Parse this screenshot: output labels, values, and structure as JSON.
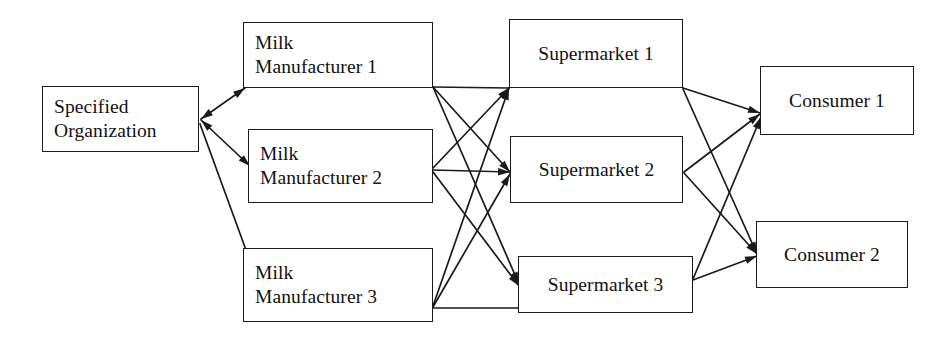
{
  "diagram": {
    "canvas": {
      "width": 952,
      "height": 337
    },
    "style": {
      "background": "#ffffff",
      "stroke": "#1a1a1a",
      "text": "#111111"
    },
    "nodes": [
      {
        "id": "specified-organization",
        "label": "Specified\nOrganization",
        "tier": "organization",
        "x": 42,
        "y": 86,
        "w": 157,
        "h": 66,
        "align": "left"
      },
      {
        "id": "milk-manufacturer-1",
        "label": "Milk\nManufacturer 1",
        "tier": "manufacturer",
        "x": 243,
        "y": 22,
        "w": 190,
        "h": 66,
        "align": "left"
      },
      {
        "id": "milk-manufacturer-2",
        "label": "Milk\nManufacturer 2",
        "tier": "manufacturer",
        "x": 248,
        "y": 129,
        "w": 185,
        "h": 74,
        "align": "left"
      },
      {
        "id": "milk-manufacturer-3",
        "label": "Milk\nManufacturer 3",
        "tier": "manufacturer",
        "x": 243,
        "y": 248,
        "w": 190,
        "h": 74,
        "align": "left"
      },
      {
        "id": "supermarket-1",
        "label": "Supermarket 1",
        "tier": "supermarket",
        "x": 509,
        "y": 19,
        "w": 174,
        "h": 69,
        "align": "center"
      },
      {
        "id": "supermarket-2",
        "label": "Supermarket 2",
        "tier": "supermarket",
        "x": 510,
        "y": 136,
        "w": 173,
        "h": 67,
        "align": "center"
      },
      {
        "id": "supermarket-3",
        "label": "Supermarket 3",
        "tier": "supermarket",
        "x": 518,
        "y": 256,
        "w": 175,
        "h": 57,
        "align": "center"
      },
      {
        "id": "consumer-1",
        "label": "Consumer 1",
        "tier": "consumer",
        "x": 760,
        "y": 66,
        "w": 154,
        "h": 69,
        "align": "center"
      },
      {
        "id": "consumer-2",
        "label": "Consumer 2",
        "tier": "consumer",
        "x": 756,
        "y": 221,
        "w": 152,
        "h": 67,
        "align": "center"
      }
    ],
    "edges": [
      {
        "id": "org-to-mm1",
        "from": "specified-organization",
        "to": "milk-manufacturer-1",
        "x1": 201,
        "y1": 119,
        "x2": 245,
        "y2": 88,
        "arrow": "both"
      },
      {
        "id": "org-to-mm2",
        "from": "specified-organization",
        "to": "milk-manufacturer-2",
        "x1": 201,
        "y1": 120,
        "x2": 250,
        "y2": 166,
        "arrow": "both"
      },
      {
        "id": "org-to-mm3",
        "from": "specified-organization",
        "to": "milk-manufacturer-3",
        "x1": 200,
        "y1": 124,
        "x2": 246,
        "y2": 250,
        "arrow": "none"
      },
      {
        "id": "mm1-to-sm1",
        "from": "milk-manufacturer-1",
        "to": "supermarket-1",
        "x1": 433,
        "y1": 87,
        "x2": 509,
        "y2": 88,
        "arrow": "none"
      },
      {
        "id": "mm1-to-sm2",
        "from": "milk-manufacturer-1",
        "to": "supermarket-2",
        "x1": 433,
        "y1": 87,
        "x2": 510,
        "y2": 172,
        "arrow": "end"
      },
      {
        "id": "mm1-to-sm3",
        "from": "milk-manufacturer-1",
        "to": "supermarket-3",
        "x1": 433,
        "y1": 87,
        "x2": 519,
        "y2": 284,
        "arrow": "end"
      },
      {
        "id": "mm2-to-sm1",
        "from": "milk-manufacturer-2",
        "to": "supermarket-1",
        "x1": 433,
        "y1": 168,
        "x2": 509,
        "y2": 88,
        "arrow": "end"
      },
      {
        "id": "mm2-to-sm2",
        "from": "milk-manufacturer-2",
        "to": "supermarket-2",
        "x1": 433,
        "y1": 170,
        "x2": 510,
        "y2": 172,
        "arrow": "end"
      },
      {
        "id": "mm2-to-sm3",
        "from": "milk-manufacturer-2",
        "to": "supermarket-3",
        "x1": 433,
        "y1": 172,
        "x2": 519,
        "y2": 286,
        "arrow": "end"
      },
      {
        "id": "mm3-to-sm1",
        "from": "milk-manufacturer-3",
        "to": "supermarket-1",
        "x1": 433,
        "y1": 306,
        "x2": 509,
        "y2": 88,
        "arrow": "end"
      },
      {
        "id": "mm3-to-sm2",
        "from": "milk-manufacturer-3",
        "to": "supermarket-2",
        "x1": 433,
        "y1": 307,
        "x2": 510,
        "y2": 174,
        "arrow": "end"
      },
      {
        "id": "mm3-to-sm3",
        "from": "milk-manufacturer-3",
        "to": "supermarket-3",
        "x1": 433,
        "y1": 308,
        "x2": 518,
        "y2": 308,
        "arrow": "none"
      },
      {
        "id": "sm1-to-con1",
        "from": "supermarket-1",
        "to": "consumer-1",
        "x1": 683,
        "y1": 88,
        "x2": 760,
        "y2": 113,
        "arrow": "end"
      },
      {
        "id": "sm1-to-con2",
        "from": "supermarket-1",
        "to": "consumer-2",
        "x1": 683,
        "y1": 89,
        "x2": 757,
        "y2": 254,
        "arrow": "end"
      },
      {
        "id": "sm2-to-con1",
        "from": "supermarket-2",
        "to": "consumer-1",
        "x1": 684,
        "y1": 172,
        "x2": 760,
        "y2": 114,
        "arrow": "end"
      },
      {
        "id": "sm2-to-con2",
        "from": "supermarket-2",
        "to": "consumer-2",
        "x1": 684,
        "y1": 173,
        "x2": 757,
        "y2": 254,
        "arrow": "end"
      },
      {
        "id": "sm3-to-con1",
        "from": "supermarket-3",
        "to": "consumer-1",
        "x1": 693,
        "y1": 279,
        "x2": 761,
        "y2": 117,
        "arrow": "end"
      },
      {
        "id": "sm3-to-con2",
        "from": "supermarket-3",
        "to": "consumer-2",
        "x1": 693,
        "y1": 280,
        "x2": 757,
        "y2": 256,
        "arrow": "end"
      }
    ]
  }
}
